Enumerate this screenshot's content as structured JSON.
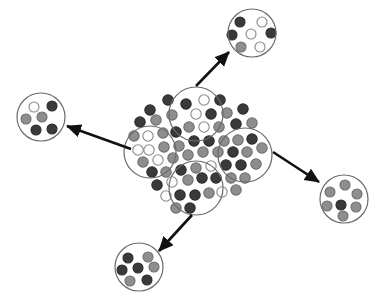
{
  "figure": {
    "background_color": "#ffffff",
    "canvas": {
      "width": 382,
      "height": 298
    }
  },
  "palette": {
    "dark_dot_fill": "#3a3a3a",
    "dark_dot_stroke": "#2b2b2b",
    "gray_dot_fill": "#8e8e8e",
    "gray_dot_stroke": "#6e6e6e",
    "white_dot_fill": "#fdfdfd",
    "white_dot_stroke": "#8a8a8a",
    "circle_outline": "#6b6b6b",
    "arrow_color": "#111111"
  },
  "geometry": {
    "dot_radius": 5.2,
    "dot_stroke_width": 1.1,
    "circle_stroke_width": 1.2,
    "arrow_stroke_width": 2.6,
    "arrow_head_size": 8
  },
  "central_cluster": {
    "name": "mixed-population",
    "center": {
      "x": 198,
      "y": 155
    },
    "dot_count": 62,
    "dots": [
      {
        "x": 168,
        "y": 100,
        "type": "dark"
      },
      {
        "x": 150,
        "y": 110,
        "type": "dark"
      },
      {
        "x": 140,
        "y": 122,
        "type": "dark"
      },
      {
        "x": 156,
        "y": 120,
        "type": "gray"
      },
      {
        "x": 172,
        "y": 115,
        "type": "gray"
      },
      {
        "x": 186,
        "y": 104,
        "type": "dark"
      },
      {
        "x": 204,
        "y": 100,
        "type": "white"
      },
      {
        "x": 220,
        "y": 100,
        "type": "dark"
      },
      {
        "x": 196,
        "y": 114,
        "type": "white"
      },
      {
        "x": 211,
        "y": 114,
        "type": "dark"
      },
      {
        "x": 227,
        "y": 113,
        "type": "gray"
      },
      {
        "x": 243,
        "y": 109,
        "type": "dark"
      },
      {
        "x": 189,
        "y": 127,
        "type": "gray"
      },
      {
        "x": 204,
        "y": 127,
        "type": "white"
      },
      {
        "x": 219,
        "y": 127,
        "type": "gray"
      },
      {
        "x": 236,
        "y": 124,
        "type": "dark"
      },
      {
        "x": 148,
        "y": 136,
        "type": "white"
      },
      {
        "x": 163,
        "y": 133,
        "type": "gray"
      },
      {
        "x": 176,
        "y": 132,
        "type": "dark"
      },
      {
        "x": 134,
        "y": 136,
        "type": "gray"
      },
      {
        "x": 252,
        "y": 123,
        "type": "gray"
      },
      {
        "x": 252,
        "y": 139,
        "type": "dark"
      },
      {
        "x": 238,
        "y": 140,
        "type": "gray"
      },
      {
        "x": 224,
        "y": 141,
        "type": "gray"
      },
      {
        "x": 209,
        "y": 141,
        "type": "dark"
      },
      {
        "x": 194,
        "y": 141,
        "type": "dark"
      },
      {
        "x": 179,
        "y": 146,
        "type": "gray"
      },
      {
        "x": 164,
        "y": 147,
        "type": "gray"
      },
      {
        "x": 149,
        "y": 150,
        "type": "white"
      },
      {
        "x": 138,
        "y": 150,
        "type": "white"
      },
      {
        "x": 143,
        "y": 162,
        "type": "gray"
      },
      {
        "x": 158,
        "y": 160,
        "type": "white"
      },
      {
        "x": 173,
        "y": 158,
        "type": "gray"
      },
      {
        "x": 188,
        "y": 155,
        "type": "gray"
      },
      {
        "x": 203,
        "y": 152,
        "type": "gray"
      },
      {
        "x": 218,
        "y": 152,
        "type": "gray"
      },
      {
        "x": 233,
        "y": 152,
        "type": "dark"
      },
      {
        "x": 247,
        "y": 152,
        "type": "gray"
      },
      {
        "x": 262,
        "y": 148,
        "type": "gray"
      },
      {
        "x": 256,
        "y": 164,
        "type": "gray"
      },
      {
        "x": 241,
        "y": 165,
        "type": "dark"
      },
      {
        "x": 226,
        "y": 165,
        "type": "dark"
      },
      {
        "x": 211,
        "y": 166,
        "type": "white"
      },
      {
        "x": 196,
        "y": 168,
        "type": "gray"
      },
      {
        "x": 181,
        "y": 170,
        "type": "dark"
      },
      {
        "x": 166,
        "y": 172,
        "type": "gray"
      },
      {
        "x": 152,
        "y": 172,
        "type": "dark"
      },
      {
        "x": 157,
        "y": 185,
        "type": "dark"
      },
      {
        "x": 172,
        "y": 182,
        "type": "white"
      },
      {
        "x": 188,
        "y": 180,
        "type": "gray"
      },
      {
        "x": 202,
        "y": 178,
        "type": "dark"
      },
      {
        "x": 216,
        "y": 178,
        "type": "dark"
      },
      {
        "x": 231,
        "y": 178,
        "type": "gray"
      },
      {
        "x": 245,
        "y": 178,
        "type": "gray"
      },
      {
        "x": 236,
        "y": 190,
        "type": "gray"
      },
      {
        "x": 222,
        "y": 192,
        "type": "white"
      },
      {
        "x": 209,
        "y": 193,
        "type": "gray"
      },
      {
        "x": 195,
        "y": 195,
        "type": "dark"
      },
      {
        "x": 180,
        "y": 195,
        "type": "dark"
      },
      {
        "x": 166,
        "y": 196,
        "type": "white"
      },
      {
        "x": 190,
        "y": 208,
        "type": "dark"
      },
      {
        "x": 176,
        "y": 208,
        "type": "gray"
      }
    ]
  },
  "inner_circles": [
    {
      "name": "inner-cluster-top",
      "cx": 196,
      "cy": 114,
      "r": 27
    },
    {
      "name": "inner-cluster-left",
      "cx": 150,
      "cy": 152,
      "r": 26
    },
    {
      "name": "inner-cluster-right",
      "cx": 245,
      "cy": 155,
      "r": 27
    },
    {
      "name": "inner-cluster-bottom",
      "cx": 196,
      "cy": 188,
      "r": 27
    }
  ],
  "extracted_circles": [
    {
      "name": "extracted-top-right",
      "cx": 252,
      "cy": 33,
      "r": 24,
      "dot_radius": 5.0,
      "dots": [
        {
          "x": 240,
          "y": 22,
          "type": "dark"
        },
        {
          "x": 262,
          "y": 22,
          "type": "white"
        },
        {
          "x": 232,
          "y": 35,
          "type": "dark"
        },
        {
          "x": 251,
          "y": 34,
          "type": "white"
        },
        {
          "x": 271,
          "y": 33,
          "type": "dark"
        },
        {
          "x": 241,
          "y": 47,
          "type": "gray"
        },
        {
          "x": 260,
          "y": 47,
          "type": "white"
        }
      ]
    },
    {
      "name": "extracted-left",
      "cx": 41,
      "cy": 117,
      "r": 24,
      "dot_radius": 5.0,
      "dots": [
        {
          "x": 34,
          "y": 107,
          "type": "white"
        },
        {
          "x": 52,
          "y": 106,
          "type": "dark"
        },
        {
          "x": 26,
          "y": 119,
          "type": "gray"
        },
        {
          "x": 42,
          "y": 117,
          "type": "gray"
        },
        {
          "x": 36,
          "y": 130,
          "type": "dark"
        },
        {
          "x": 52,
          "y": 129,
          "type": "dark"
        }
      ]
    },
    {
      "name": "extracted-bottom-left",
      "cx": 139,
      "cy": 267,
      "r": 24,
      "dot_radius": 5.0,
      "dots": [
        {
          "x": 128,
          "y": 258,
          "type": "dark"
        },
        {
          "x": 148,
          "y": 257,
          "type": "gray"
        },
        {
          "x": 122,
          "y": 270,
          "type": "dark"
        },
        {
          "x": 138,
          "y": 268,
          "type": "dark"
        },
        {
          "x": 154,
          "y": 267,
          "type": "gray"
        },
        {
          "x": 130,
          "y": 281,
          "type": "gray"
        },
        {
          "x": 147,
          "y": 280,
          "type": "dark"
        }
      ]
    },
    {
      "name": "extracted-right",
      "cx": 344,
      "cy": 199,
      "r": 24,
      "dot_radius": 5.0,
      "dots": [
        {
          "x": 345,
          "y": 185,
          "type": "gray"
        },
        {
          "x": 330,
          "y": 192,
          "type": "gray"
        },
        {
          "x": 357,
          "y": 194,
          "type": "gray"
        },
        {
          "x": 327,
          "y": 206,
          "type": "gray"
        },
        {
          "x": 341,
          "y": 205,
          "type": "dark"
        },
        {
          "x": 356,
          "y": 207,
          "type": "gray"
        },
        {
          "x": 343,
          "y": 216,
          "type": "gray"
        }
      ]
    }
  ],
  "arrows": [
    {
      "name": "arrow-to-top-right",
      "x1": 196,
      "y1": 86,
      "x2": 229,
      "y2": 52,
      "label": ""
    },
    {
      "name": "arrow-to-left",
      "x1": 131,
      "y1": 149,
      "x2": 67,
      "y2": 126,
      "label": ""
    },
    {
      "name": "arrow-to-right",
      "x1": 273,
      "y1": 152,
      "x2": 319,
      "y2": 182,
      "label": ""
    },
    {
      "name": "arrow-to-bottom-left",
      "x1": 192,
      "y1": 215,
      "x2": 159,
      "y2": 251,
      "label": ""
    }
  ]
}
